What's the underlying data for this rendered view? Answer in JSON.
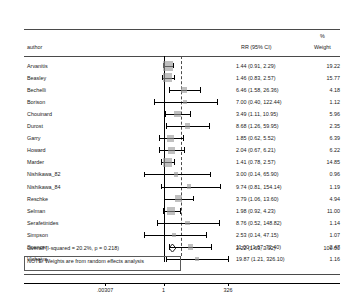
{
  "header": {
    "author_label": "author",
    "rr_label": "RR (95% CI)",
    "pct_label": "%",
    "weight_label": "Weight"
  },
  "note": "NOTE: Weights are from random effects analysis",
  "axis": {
    "tick_low": ".00307",
    "tick_mid": "1",
    "tick_high": "326"
  },
  "overall": {
    "label": "Overall  (I-squared = 20.2%, p = 0.218)",
    "ci_text": "2.22 (1.63, 3.02)",
    "weight": "100.00",
    "estimate": 2.22,
    "lower": 1.63,
    "upper": 3.02
  },
  "chart_data": {
    "type": "forest",
    "title": "",
    "xlabel": "",
    "ylabel": "",
    "effect_measure": "RR (95% CI)",
    "xscale": "log",
    "xlim": [
      0.00307,
      326
    ],
    "null_value": 1,
    "heterogeneity": "I-squared = 20.2%, p = 0.218",
    "model": "random effects",
    "columns": [
      "author",
      "RR (95% CI)",
      "% Weight"
    ],
    "studies": [
      {
        "author": "Arvanitis",
        "ci_text": "1.44 (0.91, 2.29)",
        "estimate": 1.44,
        "lower": 0.91,
        "upper": 2.29,
        "weight": 19.22
      },
      {
        "author": "Beasley",
        "ci_text": "1.46 (0.83, 2.57)",
        "estimate": 1.46,
        "lower": 0.83,
        "upper": 2.57,
        "weight": 15.77
      },
      {
        "author": "Bechelli",
        "ci_text": "6.46 (1.58, 26.36)",
        "estimate": 6.46,
        "lower": 1.58,
        "upper": 26.36,
        "weight": 4.18
      },
      {
        "author": "Borison",
        "ci_text": "7.00 (0.40, 122.44)",
        "estimate": 7.0,
        "lower": 0.4,
        "upper": 122.44,
        "weight": 1.12
      },
      {
        "author": "Chouinard",
        "ci_text": "3.49 (1.11, 10.95)",
        "estimate": 3.49,
        "lower": 1.11,
        "upper": 10.95,
        "weight": 5.96
      },
      {
        "author": "Durost",
        "ci_text": "8.68 (1.26, 59.95)",
        "estimate": 8.68,
        "lower": 1.26,
        "upper": 59.95,
        "weight": 2.35
      },
      {
        "author": "Garry",
        "ci_text": "1.85 (0.62, 5.52)",
        "estimate": 1.85,
        "lower": 0.62,
        "upper": 5.52,
        "weight": 6.39
      },
      {
        "author": "Howard",
        "ci_text": "2.04 (0.67, 6.21)",
        "estimate": 2.04,
        "lower": 0.67,
        "upper": 6.21,
        "weight": 6.22
      },
      {
        "author": "Marder",
        "ci_text": "1.41 (0.78, 2.57)",
        "estimate": 1.41,
        "lower": 0.78,
        "upper": 2.57,
        "weight": 14.85
      },
      {
        "author": "Nishikawa_82",
        "ci_text": "3.00 (0.14, 65.90)",
        "estimate": 3.0,
        "lower": 0.14,
        "upper": 65.9,
        "weight": 0.96
      },
      {
        "author": "Nishikawa_84",
        "ci_text": "9.74 (0.81, 154.14)",
        "estimate": 9.74,
        "lower": 0.81,
        "upper": 154.14,
        "weight": 1.19
      },
      {
        "author": "Reschke",
        "ci_text": "3.79 (1.06, 13.60)",
        "estimate": 3.79,
        "lower": 1.06,
        "upper": 13.6,
        "weight": 4.94
      },
      {
        "author": "Selman",
        "ci_text": "1.98 (0.92, 4.23)",
        "estimate": 1.98,
        "lower": 0.92,
        "upper": 4.23,
        "weight": 11.0
      },
      {
        "author": "Serafetinides",
        "ci_text": "8.76 (0.52, 148.82)",
        "estimate": 8.76,
        "lower": 0.52,
        "upper": 148.82,
        "weight": 1.14
      },
      {
        "author": "Simpson",
        "ci_text": "2.53 (0.14, 47.15)",
        "estimate": 2.53,
        "lower": 0.14,
        "upper": 47.15,
        "weight": 1.07
      },
      {
        "author": "Spencer",
        "ci_text": "11.00 (1.67, 72.40)",
        "estimate": 11.0,
        "lower": 1.67,
        "upper": 72.4,
        "weight": 2.47
      },
      {
        "author": "Vichaiya",
        "ci_text": "19.87 (1.21, 326.10)",
        "estimate": 19.87,
        "lower": 1.21,
        "upper": 326.1,
        "weight": 1.16
      }
    ]
  }
}
